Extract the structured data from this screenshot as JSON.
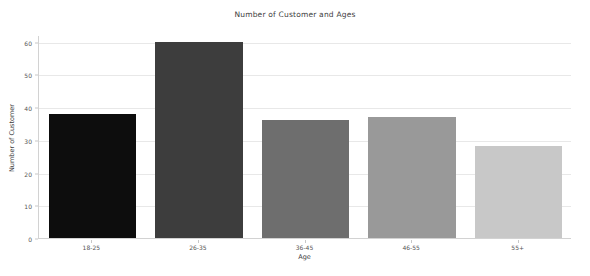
{
  "chart_data": {
    "type": "bar",
    "title": "Number of Customer and Ages",
    "xlabel": "Age",
    "ylabel": "Number of Customer",
    "categories": [
      "18-25",
      "26-35",
      "36-45",
      "46-55",
      "55+"
    ],
    "values": [
      38,
      60,
      36,
      37,
      28
    ],
    "bar_colors": [
      "#0d0d0d",
      "#3d3d3d",
      "#6e6e6e",
      "#999999",
      "#c8c8c8"
    ],
    "ylim": [
      0,
      62
    ],
    "yticks": [
      0,
      10,
      20,
      30,
      40,
      50,
      60
    ],
    "ytick_labels": [
      "0",
      "10",
      "20",
      "30",
      "40",
      "50",
      "60"
    ],
    "grid": true,
    "grid_axis": "y",
    "grid_color": "#e8e8e8",
    "legend": false,
    "background_color": "#ffffff",
    "axis_color": "#d2d2d2",
    "text_color": "#3d3d3d"
  }
}
